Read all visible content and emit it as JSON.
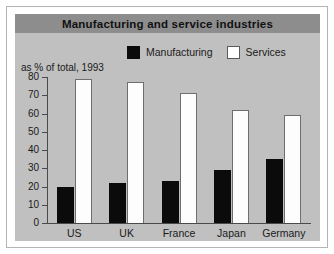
{
  "chart_data": {
    "type": "bar",
    "title": "Manufacturing and service industries",
    "ylabel": "as % of total, 1993",
    "xlabel": "",
    "categories": [
      "US",
      "UK",
      "France",
      "Japan",
      "Germany"
    ],
    "series": [
      {
        "name": "Manufacturing",
        "color": "#0b0b0b",
        "values": [
          20,
          22,
          23,
          29,
          35
        ]
      },
      {
        "name": "Services",
        "color": "#ffffff",
        "values": [
          79,
          77,
          71,
          62,
          59
        ]
      }
    ],
    "ylim": [
      0,
      80
    ],
    "yticks": [
      80,
      70,
      60,
      50,
      40,
      30,
      20,
      10,
      0
    ],
    "grid": false,
    "legend_position": "top-center"
  },
  "colors": {
    "title_bar": "#8d8d8d",
    "plot_background": "#c0c0c0",
    "axis": "#4a4a4a",
    "frame": "#b4b4b4",
    "manufacturing": "#0b0b0b",
    "services": "#ffffff"
  }
}
